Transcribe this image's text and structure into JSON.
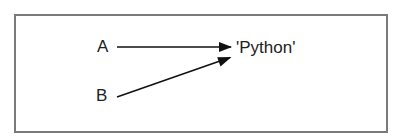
{
  "diagram": {
    "variables": [
      {
        "name": "A"
      },
      {
        "name": "B"
      }
    ],
    "value": "'Python'",
    "edges": [
      {
        "from": "A",
        "to": "'Python'"
      },
      {
        "from": "B",
        "to": "'Python'"
      }
    ],
    "colors": {
      "border": "#7a7a7a",
      "text": "#222222",
      "arrow": "#111111"
    }
  }
}
